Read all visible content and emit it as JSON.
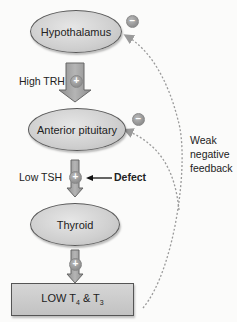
{
  "diagram": {
    "nodes": {
      "hypothalamus": "Hypothalamus",
      "anterior_pituitary": "Anterior pituitary",
      "thyroid": "Thyroid",
      "output_box": {
        "prefix": "LOW T",
        "sub1": "4",
        "mid": " & T",
        "sub2": "3"
      }
    },
    "edges": {
      "trh_label": "High TRH",
      "tsh_label": "Low TSH",
      "defect_label": "Defect",
      "feedback_label_lines": [
        "Weak",
        "negative",
        "feedback"
      ]
    },
    "signs": {
      "plus": "+",
      "minus": "−"
    },
    "colors": {
      "node_fill": "#cfcfcf",
      "border": "#5a5a5a",
      "arrow_fill": "#a8a8a8",
      "dotted": "#9a9a9a"
    }
  }
}
